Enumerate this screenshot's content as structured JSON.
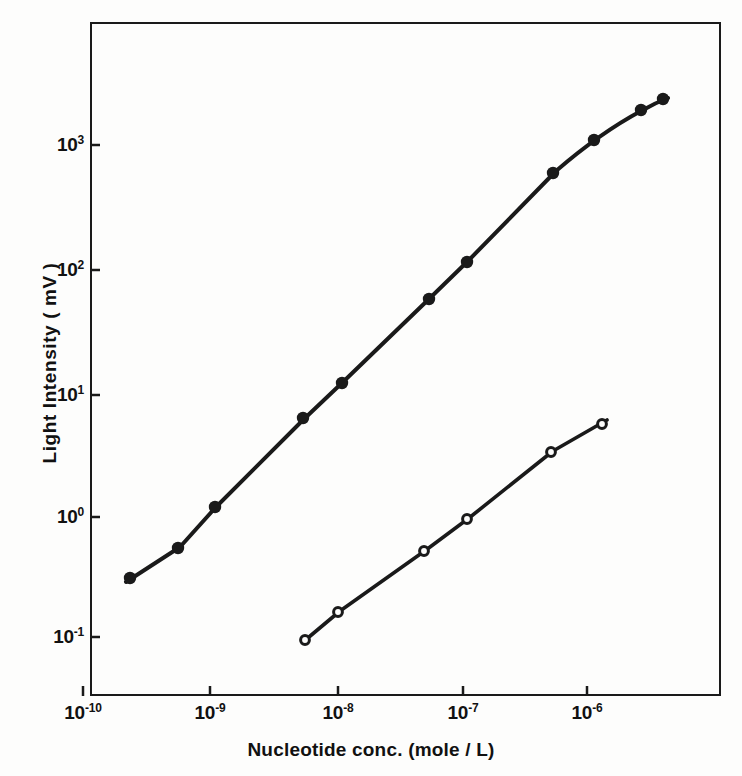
{
  "figure": {
    "background_color": "#fdfdfc",
    "ink_color": "#1a1a1a"
  },
  "axes": {
    "x_title": "Nucleotide conc. (mole / L)",
    "y_title": "Light Intensity ( mV )",
    "x_ticks": [
      {
        "label_base": "10",
        "label_exp": "-10",
        "value": 1e-10,
        "px": 83
      },
      {
        "label_base": "10",
        "label_exp": "-9",
        "value": 1e-09,
        "px": 210
      },
      {
        "label_base": "10",
        "label_exp": "-8",
        "value": 1e-08,
        "px": 338
      },
      {
        "label_base": "10",
        "label_exp": "-7",
        "value": 1e-07,
        "px": 463
      },
      {
        "label_base": "10",
        "label_exp": "-6",
        "value": 1e-06,
        "px": 587
      }
    ],
    "y_ticks": [
      {
        "label_base": "10",
        "label_exp": "3",
        "value": 1000,
        "px": 145
      },
      {
        "label_base": "10",
        "label_exp": "2",
        "value": 100,
        "px": 270
      },
      {
        "label_base": "10",
        "label_exp": "1",
        "value": 10,
        "px": 395
      },
      {
        "label_base": "10",
        "label_exp": "0",
        "value": 1,
        "px": 517
      },
      {
        "label_base": "10",
        "label_exp": "-1",
        "value": 0.1,
        "px": 637
      }
    ]
  },
  "chart_data": {
    "type": "scatter",
    "title": "",
    "xlabel": "Nucleotide conc. (mole / L)",
    "ylabel": "Light Intensity ( mV )",
    "xscale": "log",
    "yscale": "log",
    "xlim": [
      6.5e-11,
      7.5e-06
    ],
    "ylim": [
      0.055,
      6500
    ],
    "grid": false,
    "legend": null,
    "series": [
      {
        "name": "filled-circles",
        "marker": "filled-circle",
        "marker_size": 9,
        "color": "#1a1a1a",
        "line": "smooth",
        "x": [
          2e-10,
          4.5e-10,
          1e-09,
          5e-09,
          1e-08,
          5e-08,
          1e-07,
          5e-07,
          1e-06,
          2e-06,
          3e-06
        ],
        "y": [
          0.3,
          0.55,
          1.1,
          6.0,
          11.0,
          55.0,
          110.0,
          600.0,
          1100.0,
          1900.0,
          2300.0
        ]
      },
      {
        "name": "open-circles",
        "marker": "open-circle",
        "marker_size": 7,
        "color": "#1a1a1a",
        "line": "straight",
        "x": [
          5e-09,
          1e-08,
          5e-08,
          1e-07,
          5e-07,
          1.1e-06
        ],
        "y": [
          0.095,
          0.15,
          0.45,
          0.78,
          2.6,
          5.4
        ]
      }
    ]
  },
  "geometry": {
    "frame": {
      "left": 90,
      "top": 22,
      "width": 631,
      "height": 674
    },
    "filled_points_px": [
      [
        130,
        578
      ],
      [
        178,
        548
      ],
      [
        215,
        507
      ],
      [
        303,
        418
      ],
      [
        342,
        383
      ],
      [
        429,
        299
      ],
      [
        467,
        262
      ],
      [
        553,
        173
      ],
      [
        594,
        140
      ],
      [
        641,
        110
      ],
      [
        663,
        99
      ]
    ],
    "open_points_px": [
      [
        305,
        640
      ],
      [
        338,
        612
      ],
      [
        424,
        551
      ],
      [
        467,
        519
      ],
      [
        551,
        452
      ],
      [
        602,
        424
      ]
    ],
    "filled_path_px": "M 126,582 L 180,547 L 216,507 L 304,419 L 343,382 L 430,298 L 468,261 L 556,171 Q 600,133 641,111 Q 655,103 668,98",
    "open_path_px": "M 303,642 L 340,611 L 426,550 L 469,518 L 553,451 L 607,420"
  }
}
